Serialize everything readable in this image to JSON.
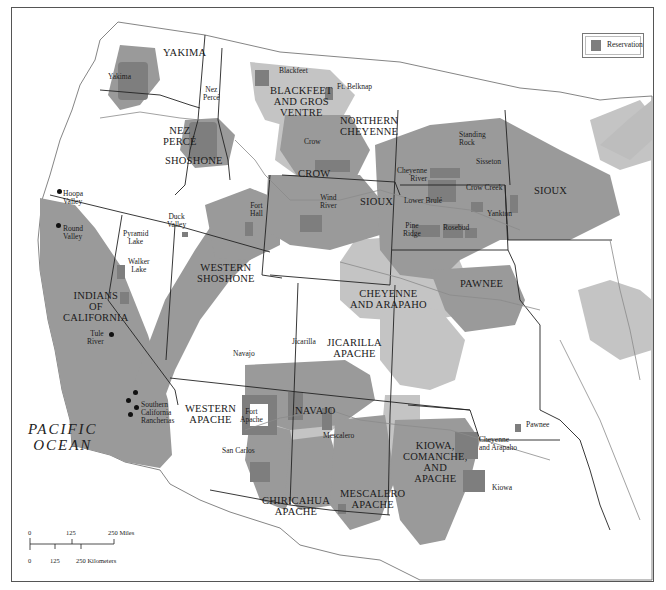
{
  "legend": {
    "label": "Reservation",
    "swatch_color": "#7e7e7e"
  },
  "colors": {
    "reservation": "#7e7e7e",
    "tribal_land_dark": "#9a9a9a",
    "tribal_land_light": "#c4c4c4",
    "land": "#ffffff",
    "lake": "#bdbdbd",
    "border": "#222222",
    "river": "#8a8a8a"
  },
  "ocean_label": {
    "line1": "PACIFIC",
    "line2": "OCEAN"
  },
  "tribal_regions": [
    {
      "id": "yakima",
      "line1": "YAKIMA",
      "line2": "",
      "line3": ""
    },
    {
      "id": "nez-perce",
      "line1": "NEZ",
      "line2": "PERCÉ",
      "line3": ""
    },
    {
      "id": "shoshone",
      "line1": "SHOSHONE",
      "line2": "",
      "line3": ""
    },
    {
      "id": "blackfeet-gros-ventre",
      "line1": "BLACKFEET",
      "line2": "AND GROS",
      "line3": "VENTRE"
    },
    {
      "id": "northern-cheyenne",
      "line1": "NORTHERN",
      "line2": "CHEYENNE",
      "line3": ""
    },
    {
      "id": "crow",
      "line1": "CROW",
      "line2": "",
      "line3": ""
    },
    {
      "id": "sioux-west",
      "line1": "SIOUX",
      "line2": "",
      "line3": ""
    },
    {
      "id": "sioux-east",
      "line1": "SIOUX",
      "line2": "",
      "line3": ""
    },
    {
      "id": "western-shoshone",
      "line1": "WESTERN",
      "line2": "SHOSHONE",
      "line3": ""
    },
    {
      "id": "indians-of-california",
      "line1": "INDIANS",
      "line2": "OF",
      "line3": "CALIFORNIA"
    },
    {
      "id": "pawnee",
      "line1": "PAWNEE",
      "line2": "",
      "line3": ""
    },
    {
      "id": "cheyenne-arapaho",
      "line1": "CHEYENNE",
      "line2": "AND ARAPAHO",
      "line3": ""
    },
    {
      "id": "jicarilla-apache",
      "line1": "JICARILLA",
      "line2": "APACHE",
      "line3": ""
    },
    {
      "id": "western-apache",
      "line1": "WESTERN",
      "line2": "APACHE",
      "line3": ""
    },
    {
      "id": "navajo",
      "line1": "NAVAJO",
      "line2": "",
      "line3": ""
    },
    {
      "id": "kiowa-comanche-apache",
      "line1": "KIOWA,",
      "line2": "COMANCHE,",
      "line3": "AND",
      "line4": "APACHE"
    },
    {
      "id": "chiricahua-apache",
      "line1": "CHIRICAHUA",
      "line2": "APACHE",
      "line3": ""
    },
    {
      "id": "mescalero-apache",
      "line1": "MESCALERO",
      "line2": "APACHE",
      "line3": ""
    }
  ],
  "reservations": [
    {
      "id": "yakima",
      "line1": "Yakima",
      "line2": ""
    },
    {
      "id": "nez-perce",
      "line1": "Nez",
      "line2": "Percé"
    },
    {
      "id": "blackfeet",
      "line1": "Blackfeet",
      "line2": ""
    },
    {
      "id": "ft-belknap",
      "line1": "Ft. Belknap",
      "line2": ""
    },
    {
      "id": "crow",
      "line1": "Crow",
      "line2": ""
    },
    {
      "id": "standing-rock",
      "line1": "Standing",
      "line2": "Rock"
    },
    {
      "id": "sisseton",
      "line1": "Sisseton",
      "line2": ""
    },
    {
      "id": "cheyenne-river",
      "line1": "Cheyenne",
      "line2": "River"
    },
    {
      "id": "crow-creek",
      "line1": "Crow Creek",
      "line2": ""
    },
    {
      "id": "lower-brule",
      "line1": "Lower Brulé",
      "line2": ""
    },
    {
      "id": "yankton",
      "line1": "Yankton",
      "line2": ""
    },
    {
      "id": "pine-ridge",
      "line1": "Pine",
      "line2": "Ridge"
    },
    {
      "id": "rosebud",
      "line1": "Rosebud",
      "line2": ""
    },
    {
      "id": "wind-river",
      "line1": "Wind",
      "line2": "River"
    },
    {
      "id": "fort-hall",
      "line1": "Fort",
      "line2": "Hall"
    },
    {
      "id": "duck-valley",
      "line1": "Duck",
      "line2": "Valley"
    },
    {
      "id": "pyramid-lake",
      "line1": "Pyramid",
      "line2": "Lake"
    },
    {
      "id": "walker-lake",
      "line1": "Walker",
      "line2": "Lake"
    },
    {
      "id": "hoopa-valley",
      "line1": "Hoopa",
      "line2": "Valley"
    },
    {
      "id": "round-valley",
      "line1": "Round",
      "line2": "Valley"
    },
    {
      "id": "tule-river",
      "line1": "Tule",
      "line2": "River"
    },
    {
      "id": "southern-california-rancherias",
      "line1": "Southern",
      "line2": "California",
      "line3": "Rancherias"
    },
    {
      "id": "navajo",
      "line1": "Navajo",
      "line2": ""
    },
    {
      "id": "jicarilla",
      "line1": "Jicarilla",
      "line2": ""
    },
    {
      "id": "fort-apache",
      "line1": "Fort",
      "line2": "Apache"
    },
    {
      "id": "san-carlos",
      "line1": "San Carlos",
      "line2": ""
    },
    {
      "id": "mescalero",
      "line1": "Mescalero",
      "line2": ""
    },
    {
      "id": "pawnee",
      "line1": "Pawnee",
      "line2": ""
    },
    {
      "id": "cheyenne-arapaho",
      "line1": "Cheyenne",
      "line2": "and Arapaho"
    },
    {
      "id": "kiowa",
      "line1": "Kiowa",
      "line2": ""
    }
  ],
  "scale_bar": {
    "miles": {
      "labels": [
        "0",
        "125",
        "250 Miles"
      ]
    },
    "kilometers": {
      "labels": [
        "0",
        "125",
        "250 Kilometers"
      ]
    }
  }
}
